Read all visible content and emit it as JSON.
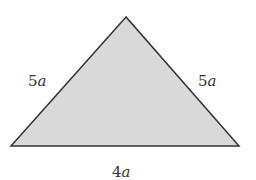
{
  "diagram": {
    "shape": "isosceles-triangle",
    "fill_color": "#d9d9d9",
    "stroke_color": "#333333",
    "vertices": {
      "apex": [
        126,
        17
      ],
      "bottom_left": [
        11,
        146
      ],
      "bottom_right": [
        239,
        146
      ]
    },
    "labels": {
      "left_side": {
        "coef": "5",
        "var": "a"
      },
      "right_side": {
        "coef": "5",
        "var": "a"
      },
      "base": {
        "coef": "4",
        "var": "a"
      }
    }
  }
}
